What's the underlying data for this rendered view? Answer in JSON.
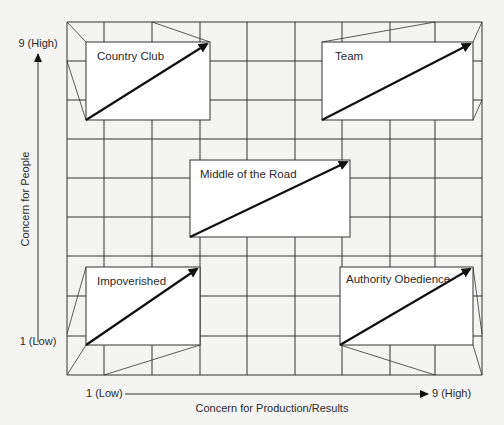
{
  "diagram": {
    "type": "managerial-grid",
    "colors": {
      "background": "#f4f4f2",
      "line": "#333333",
      "box_fill": "#ffffff",
      "arrow": "#111111",
      "text": "#2a2a2a"
    },
    "grid": {
      "left": 67,
      "top": 22,
      "right": 482,
      "bottom": 375,
      "vertical_lines": [
        67,
        104,
        152,
        200,
        247,
        295,
        342,
        390,
        435,
        482
      ],
      "horizontal_lines": [
        22,
        61,
        100,
        139,
        178,
        217,
        256,
        296,
        336,
        375
      ]
    },
    "y_axis": {
      "label": "Concern for People",
      "high_label": "9 (High)",
      "low_label": "1 (Low)"
    },
    "x_axis": {
      "label": "Concern for Production/Results",
      "low_label": "1 (Low)",
      "high_label": "9 (High)"
    },
    "styles": [
      {
        "name": "Country Club",
        "box": {
          "x1": 86,
          "y1": 42,
          "x2": 210,
          "y2": 120
        },
        "connectors": [
          [
            67,
            22,
            86,
            42
          ],
          [
            67,
            61,
            86,
            120
          ],
          [
            210,
            42,
            152,
            22
          ]
        ],
        "title_pos": [
          97,
          60
        ]
      },
      {
        "name": "Team",
        "box": {
          "x1": 322,
          "y1": 42,
          "x2": 473,
          "y2": 120
        },
        "connectors": [
          [
            322,
            42,
            435,
            22
          ],
          [
            473,
            42,
            482,
            22
          ],
          [
            473,
            120,
            482,
            100
          ]
        ],
        "title_pos": [
          335,
          60
        ]
      },
      {
        "name": "Middle of the Road",
        "box": {
          "x1": 190,
          "y1": 160,
          "x2": 350,
          "y2": 237
        },
        "connectors": [],
        "title_pos": [
          200,
          178
        ]
      },
      {
        "name": "Impoverished",
        "box": {
          "x1": 86,
          "y1": 267,
          "x2": 200,
          "y2": 345
        },
        "connectors": [
          [
            86,
            267,
            67,
            334
          ],
          [
            86,
            345,
            67,
            375
          ],
          [
            200,
            345,
            104,
            375
          ]
        ],
        "title_pos": [
          97,
          285
        ]
      },
      {
        "name": "Authority Obedience",
        "box": {
          "x1": 340,
          "y1": 267,
          "x2": 473,
          "y2": 345
        },
        "connectors": [
          [
            340,
            345,
            435,
            375
          ],
          [
            473,
            267,
            482,
            334
          ],
          [
            473,
            345,
            482,
            375
          ]
        ],
        "title_pos": [
          346,
          283
        ]
      }
    ]
  }
}
